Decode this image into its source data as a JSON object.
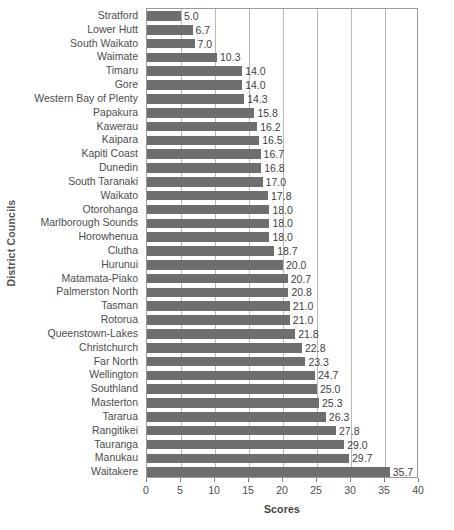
{
  "chart_data": {
    "type": "bar",
    "orientation": "horizontal",
    "title": "",
    "xlabel": "Scores",
    "ylabel": "District Councils",
    "xlim": [
      0,
      40
    ],
    "xticks": [
      0,
      5,
      10,
      15,
      20,
      25,
      30,
      35,
      40
    ],
    "grid": true,
    "legend": false,
    "bar_color": "#6e6e6e",
    "categories": [
      "Stratford",
      "Lower Hutt",
      "South Waikato",
      "Waimate",
      "Timaru",
      "Gore",
      "Western Bay of Plenty",
      "Papakura",
      "Kawerau",
      "Kaipara",
      "Kapiti Coast",
      "Dunedin",
      "South Taranaki",
      "Waikato",
      "Otorohanga",
      "Marlborough Sounds",
      "Horowhenua",
      "Clutha",
      "Hurunui",
      "Matamata-Piako",
      "Palmerston North",
      "Tasman",
      "Rotorua",
      "Queenstown-Lakes",
      "Christchurch",
      "Far North",
      "Wellington",
      "Southland",
      "Masterton",
      "Tararua",
      "Rangitikei",
      "Tauranga",
      "Manukau",
      "Waitakere"
    ],
    "values": [
      5.0,
      6.7,
      7.0,
      10.3,
      14.0,
      14.0,
      14.3,
      15.8,
      16.2,
      16.5,
      16.7,
      16.8,
      17.0,
      17.8,
      18.0,
      18.0,
      18.0,
      18.7,
      20.0,
      20.7,
      20.8,
      21.0,
      21.0,
      21.8,
      22.8,
      23.3,
      24.7,
      25.0,
      25.3,
      26.3,
      27.8,
      29.0,
      29.7,
      35.7
    ],
    "value_labels": [
      "5.0",
      "6.7",
      "7.0",
      "10.3",
      "14.0",
      "14.0",
      "14.3",
      "15.8",
      "16.2",
      "16.5",
      "16.7",
      "16.8",
      "17.0",
      "17.8",
      "18.0",
      "18.0",
      "18.0",
      "18.7",
      "20.0",
      "20.7",
      "20.8",
      "21.0",
      "21.0",
      "21.8",
      "22.8",
      "23.3",
      "24.7",
      "25.0",
      "25.3",
      "26.3",
      "27.8",
      "29.0",
      "29.7",
      "35.7"
    ]
  }
}
